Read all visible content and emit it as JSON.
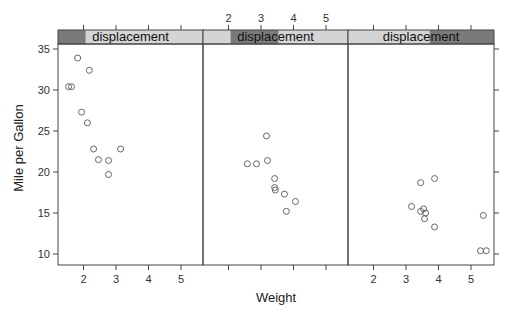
{
  "chart_data": {
    "type": "scatter",
    "layout": "lattice-3-panels",
    "xlabel": "Weight",
    "ylabel": "Mile per Gallon",
    "xlim": [
      1.2,
      5.7
    ],
    "ylim": [
      9,
      36.5
    ],
    "x_ticks": [
      2,
      3,
      4,
      5
    ],
    "y_ticks": [
      10,
      15,
      20,
      25,
      30,
      35
    ],
    "grid": false,
    "panels": [
      {
        "strip_label": "displacement",
        "shingle_range": [
          0,
          0.19
        ],
        "points": [
          {
            "x": 1.54,
            "y": 30.4
          },
          {
            "x": 1.63,
            "y": 30.4
          },
          {
            "x": 1.82,
            "y": 33.9
          },
          {
            "x": 2.18,
            "y": 32.4
          },
          {
            "x": 1.94,
            "y": 27.3
          },
          {
            "x": 2.12,
            "y": 26.0
          },
          {
            "x": 2.31,
            "y": 22.8
          },
          {
            "x": 2.46,
            "y": 21.5
          },
          {
            "x": 2.77,
            "y": 21.4
          },
          {
            "x": 2.77,
            "y": 19.7
          },
          {
            "x": 3.14,
            "y": 22.8
          }
        ]
      },
      {
        "strip_label": "displacement",
        "shingle_range": [
          0.19,
          0.52
        ],
        "points": [
          {
            "x": 2.58,
            "y": 21.0
          },
          {
            "x": 2.86,
            "y": 21.0
          },
          {
            "x": 3.17,
            "y": 24.4
          },
          {
            "x": 3.2,
            "y": 21.4
          },
          {
            "x": 3.42,
            "y": 19.2
          },
          {
            "x": 3.42,
            "y": 18.1
          },
          {
            "x": 3.44,
            "y": 17.8
          },
          {
            "x": 3.72,
            "y": 17.3
          },
          {
            "x": 4.06,
            "y": 16.4
          },
          {
            "x": 3.78,
            "y": 15.2
          }
        ]
      },
      {
        "strip_label": "displacement",
        "shingle_range": [
          0.56,
          1.0
        ],
        "points": [
          {
            "x": 3.45,
            "y": 18.7
          },
          {
            "x": 3.88,
            "y": 19.2
          },
          {
            "x": 3.17,
            "y": 15.8
          },
          {
            "x": 3.45,
            "y": 15.2
          },
          {
            "x": 3.54,
            "y": 15.5
          },
          {
            "x": 3.6,
            "y": 15.0
          },
          {
            "x": 3.57,
            "y": 14.3
          },
          {
            "x": 3.88,
            "y": 13.3
          },
          {
            "x": 5.38,
            "y": 14.7
          },
          {
            "x": 5.29,
            "y": 10.4
          },
          {
            "x": 5.47,
            "y": 10.4
          }
        ]
      }
    ]
  },
  "colors": {
    "strip_light": "#d4d4d4",
    "strip_dark": "#7a7a7a",
    "frame": "#444444",
    "point": "#666666"
  }
}
